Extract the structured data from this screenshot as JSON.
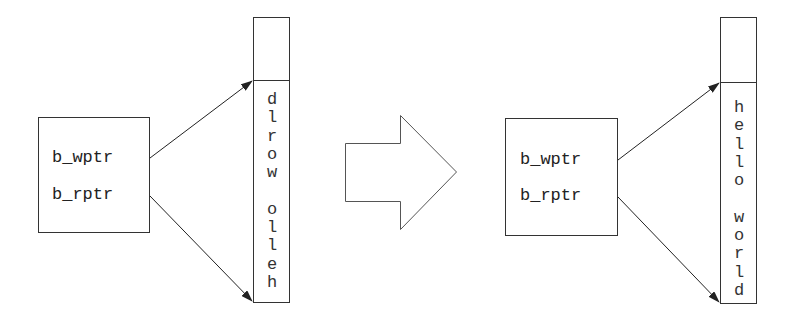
{
  "left": {
    "pointers": [
      "b_wptr",
      "b_rptr"
    ],
    "buffer_chars": [
      "d",
      "l",
      "r",
      "o",
      "w",
      " ",
      "o",
      "l",
      "l",
      "e",
      "h"
    ],
    "buffer_text": "dlrow olleh"
  },
  "right": {
    "pointers": [
      "b_wptr",
      "b_rptr"
    ],
    "buffer_chars": [
      "h",
      "e",
      "l",
      "l",
      "o",
      " ",
      "w",
      "o",
      "r",
      "l",
      "d"
    ],
    "buffer_text": "hello world"
  },
  "transition_arrow": "right-arrow",
  "colors": {
    "stroke": "#333333",
    "background": "#ffffff"
  }
}
